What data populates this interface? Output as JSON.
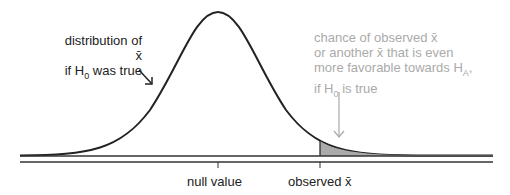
{
  "diagram": {
    "distribution_label_line1": "distribution of x̄",
    "distribution_label_line2_prefix": "if H",
    "distribution_label_line2_sub": "0",
    "distribution_label_line2_suffix": " was true",
    "pvalue_line1": "chance of observed x̄",
    "pvalue_line2": "or another x̄ that is even",
    "pvalue_line3_prefix": "more favorable towards H",
    "pvalue_line3_sub": "A",
    "pvalue_line3_suffix": ",",
    "pvalue_line4_prefix": "if H",
    "pvalue_line4_sub": "0",
    "pvalue_line4_suffix": " is true",
    "null_label": "null value",
    "observed_label": "observed x̄",
    "shade_color": "#aaaaaa",
    "annotation_color": "#aaaaaa"
  }
}
